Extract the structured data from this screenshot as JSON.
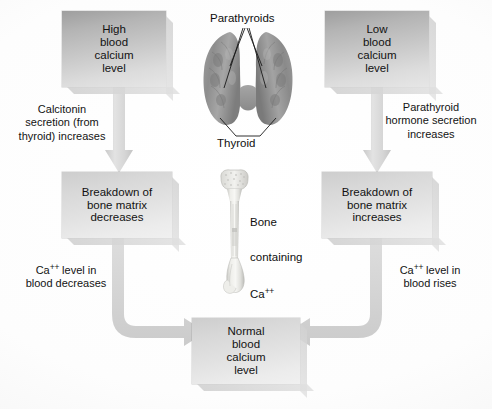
{
  "diagram": {
    "type": "flowchart",
    "background_color": "#ffffff",
    "box_fill_dark": "#b4b4b4",
    "box_fill_light": "#e0e0e0",
    "arrow_color": "#d5d5d5",
    "text_color": "#121212"
  },
  "boxes": {
    "high_calcium": "High\nblood\ncalcium\nlevel",
    "low_calcium": "Low\nblood\ncalcium\nlevel",
    "breakdown_decreases": "Breakdown of\nbone matrix\ndecreases",
    "breakdown_increases": "Breakdown of\nbone matrix\nincreases",
    "normal_calcium": "Normal\nblood\ncalcium\nlevel"
  },
  "notes": {
    "calcitonin": "Calcitonin\nsecretion (from\nthyroid) increases",
    "parathyroid_hormone": "Parathyroid\nhormone secretion\nincreases",
    "ca_decreases_prefix": "Ca",
    "ca_decreases_sup": "++",
    "ca_decreases_suffix": " level in\nblood decreases",
    "ca_rises_prefix": "Ca",
    "ca_rises_sup": "++",
    "ca_rises_suffix": " level in\nblood rises"
  },
  "anatomy": {
    "parathyroids_label": "Parathyroids",
    "thyroid_label": "Thyroid",
    "bone_label_line1": "Bone",
    "bone_label_line2": "containing",
    "bone_label_line3_prefix": "Ca",
    "bone_label_line3_sup": "++"
  },
  "flow": {
    "left_branch": [
      "high_calcium",
      "breakdown_decreases",
      "normal_calcium"
    ],
    "right_branch": [
      "low_calcium",
      "breakdown_increases",
      "normal_calcium"
    ]
  }
}
